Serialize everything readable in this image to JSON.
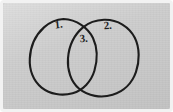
{
  "figure": {
    "kind": "hand-drawn-venn-diagram",
    "background_color": "#cbcbcb",
    "paper_edge_color": "#f2f2f2",
    "ink_color": "#1c1c1c",
    "width": 173,
    "height": 112
  },
  "regions": [
    {
      "id": "left-only",
      "label": "1.",
      "label_x": 59,
      "label_y": 28,
      "description": "left circle exclusive region"
    },
    {
      "id": "right-only",
      "label": "2.",
      "label_x": 108,
      "label_y": 29,
      "description": "right circle exclusive region"
    },
    {
      "id": "intersection",
      "label": "3.",
      "label_x": 84,
      "label_y": 42,
      "description": "overlap of both circles"
    }
  ],
  "shapes": [
    {
      "id": "left-circle",
      "center_x": 63,
      "center_y": 57,
      "radius_x": 33,
      "radius_y": 38
    },
    {
      "id": "right-circle",
      "center_x": 104,
      "center_y": 58,
      "radius_x": 34,
      "radius_y": 39
    }
  ]
}
